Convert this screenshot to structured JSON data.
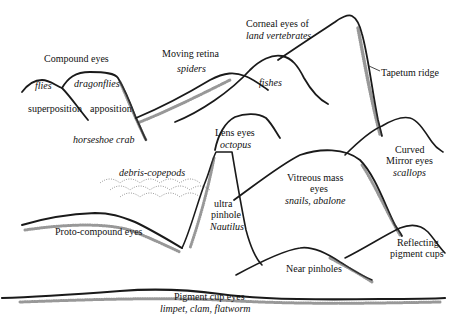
{
  "diagram": {
    "title": "",
    "peaks": {
      "compound_eyes": {
        "label": "Compound eyes",
        "sub_flies": "flies",
        "sub_dragonflies": "dragonflies",
        "superposition": "superposition",
        "apposition": "apposition",
        "example": "horseshoe crab"
      },
      "moving_retina": {
        "label": "Moving retina",
        "example": "spiders"
      },
      "corneal_eyes": {
        "label_line1": "Corneal eyes of",
        "label_line2": "land vertebrates",
        "example": "fishes"
      },
      "tapetum": {
        "label": "Tapetum ridge"
      },
      "lens_eyes": {
        "label": "Lens eyes",
        "example": "octopus"
      },
      "mirror_eyes": {
        "label_line1": "Curved",
        "label_line2": "Mirror eyes",
        "example": "scallops"
      },
      "debris": {
        "label": "debris-copepods"
      },
      "vitreous": {
        "label_line1": "Vitreous mass",
        "label_line2": "eyes",
        "example": "snails, abalone"
      },
      "pinhole": {
        "label_line1": "ultra",
        "label_line2": "pinhole",
        "example": "Nautilus"
      },
      "proto_compound": {
        "label": "Proto-compound eyes"
      },
      "reflecting": {
        "label_line1": "Reflecting",
        "label_line2": "pigment cups"
      },
      "near_pinholes": {
        "label": "Near pinholes"
      },
      "pigment_cup": {
        "label": "Pigment cup eyes",
        "example": "limpet, clam, flatworm"
      }
    },
    "colors": {
      "ink": "#1a1a1a",
      "background": "#ffffff"
    }
  }
}
